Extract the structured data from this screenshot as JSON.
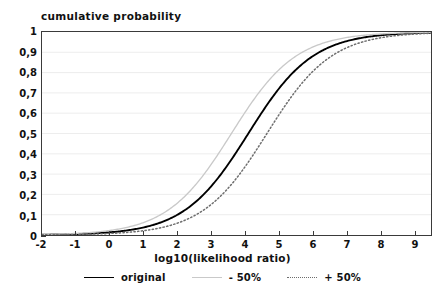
{
  "chart_data": {
    "type": "line",
    "title": "cumulative probability",
    "xlabel": "log10(likelihood ratio)",
    "ylabel": "",
    "xlim": [
      -2,
      9.5
    ],
    "ylim": [
      0,
      1
    ],
    "grid": "horizontal",
    "legend_position": "bottom",
    "x_ticks": [
      "-2",
      "-1",
      "0",
      "1",
      "2",
      "3",
      "4",
      "5",
      "6",
      "7",
      "8",
      "9"
    ],
    "x_tick_values": [
      -2,
      -1,
      0,
      1,
      2,
      3,
      4,
      5,
      6,
      7,
      8,
      9
    ],
    "y_ticks": [
      "0",
      "0,1",
      "0,2",
      "0,3",
      "0,4",
      "0,5",
      "0,6",
      "0,7",
      "0,8",
      "0,9",
      "1"
    ],
    "y_tick_values": [
      0,
      0.1,
      0.2,
      0.3,
      0.4,
      0.5,
      0.6,
      0.7,
      0.8,
      0.9,
      1
    ],
    "x": [
      -2,
      -1.5,
      -1,
      -0.5,
      0,
      0.5,
      1,
      1.5,
      2,
      2.5,
      3,
      3.5,
      4,
      4.5,
      5,
      5.5,
      6,
      6.5,
      7,
      7.5,
      8,
      8.5,
      9,
      9.5
    ],
    "series": [
      {
        "name": "original",
        "style": "solid",
        "color": "#000000",
        "midpoint": 4.1,
        "values": [
          0.002,
          0.004,
          0.006,
          0.01,
          0.016,
          0.026,
          0.042,
          0.066,
          0.1,
          0.15,
          0.215,
          0.3,
          0.4,
          0.505,
          0.61,
          0.705,
          0.79,
          0.855,
          0.905,
          0.94,
          0.964,
          0.979,
          0.989,
          0.995
        ]
      },
      {
        "name": "- 50%",
        "style": "solid",
        "color": "#c9c9c9",
        "midpoint": 3.6,
        "values": [
          0.003,
          0.005,
          0.009,
          0.015,
          0.024,
          0.038,
          0.06,
          0.092,
          0.138,
          0.203,
          0.288,
          0.39,
          0.5,
          0.61,
          0.71,
          0.795,
          0.862,
          0.91,
          0.944,
          0.966,
          0.98,
          0.989,
          0.994,
          0.997
        ]
      },
      {
        "name": "+ 50%",
        "style": "dotted",
        "color": "#6d6d6d",
        "midpoint": 4.65,
        "values": [
          0.002,
          0.003,
          0.005,
          0.009,
          0.014,
          0.023,
          0.037,
          0.058,
          0.089,
          0.134,
          0.194,
          0.27,
          0.36,
          0.46,
          0.56,
          0.655,
          0.742,
          0.815,
          0.872,
          0.915,
          0.945,
          0.966,
          0.98,
          0.989
        ]
      }
    ],
    "legend": [
      {
        "label": "original",
        "style": "solid",
        "color": "#000000"
      },
      {
        "label": "- 50%",
        "style": "light",
        "color": "#c9c9c9"
      },
      {
        "label": "+ 50%",
        "style": "dotted",
        "color": "#6d6d6d"
      }
    ]
  },
  "colors": {
    "axis": "#3a3a3a",
    "grid": "#ededed",
    "text": "#111111",
    "background": "#ffffff"
  }
}
